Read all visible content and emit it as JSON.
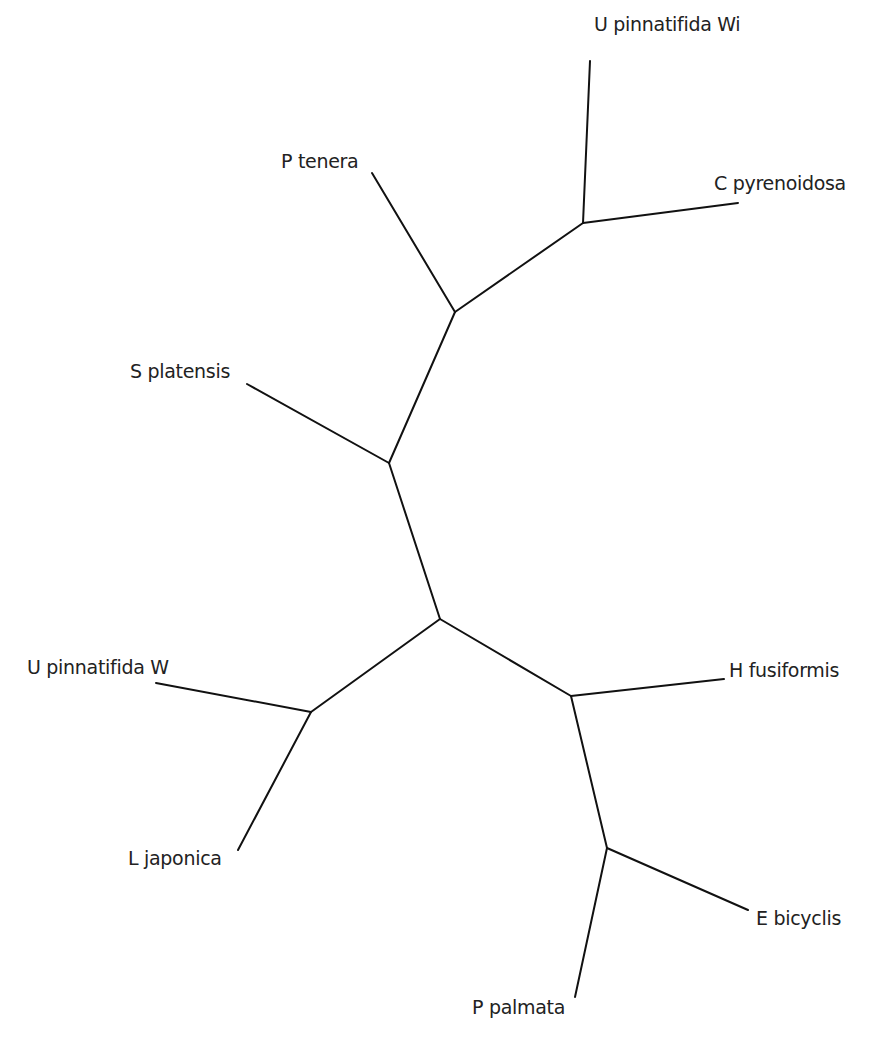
{
  "diagram": {
    "type": "unrooted-phylogenetic-tree",
    "line_color": "#111111",
    "text_color": "#222222",
    "nodes": {
      "n_center": {
        "x": 440,
        "y": 619
      },
      "n_upper": {
        "x": 389,
        "y": 463
      },
      "n_ptenera": {
        "x": 455,
        "y": 312
      },
      "n_chloro": {
        "x": 583,
        "y": 223
      },
      "n_left": {
        "x": 311,
        "y": 712
      },
      "n_right": {
        "x": 571,
        "y": 696
      },
      "n_bottom": {
        "x": 607,
        "y": 848
      }
    },
    "taxa": [
      {
        "label": "U pinnatifida Wi",
        "tip": {
          "x": 590,
          "y": 61
        },
        "parent": "n_chloro",
        "label_pos": {
          "x": 594,
          "y": 31
        }
      },
      {
        "label": "C pyrenoidosa",
        "tip": {
          "x": 738,
          "y": 203
        },
        "parent": "n_chloro",
        "label_pos": {
          "x": 714,
          "y": 190
        }
      },
      {
        "label": "P tenera",
        "tip": {
          "x": 372,
          "y": 173
        },
        "parent": "n_ptenera",
        "label_pos": {
          "x": 281,
          "y": 168
        }
      },
      {
        "label": "S platensis",
        "tip": {
          "x": 247,
          "y": 384
        },
        "parent": "n_upper",
        "label_pos": {
          "x": 130,
          "y": 378
        }
      },
      {
        "label": "U pinnatifida W",
        "tip": {
          "x": 156,
          "y": 683
        },
        "parent": "n_left",
        "label_pos": {
          "x": 27,
          "y": 674
        }
      },
      {
        "label": "L japonica",
        "tip": {
          "x": 238,
          "y": 850
        },
        "parent": "n_left",
        "label_pos": {
          "x": 128,
          "y": 865
        }
      },
      {
        "label": "H fusiformis",
        "tip": {
          "x": 724,
          "y": 679
        },
        "parent": "n_right",
        "label_pos": {
          "x": 729,
          "y": 677
        }
      },
      {
        "label": "E bicyclis",
        "tip": {
          "x": 748,
          "y": 910
        },
        "parent": "n_bottom",
        "label_pos": {
          "x": 756,
          "y": 925
        }
      },
      {
        "label": "P palmata",
        "tip": {
          "x": 575,
          "y": 997
        },
        "parent": "n_bottom",
        "label_pos": {
          "x": 472,
          "y": 1014
        }
      }
    ],
    "internal_edges": [
      {
        "from": "n_center",
        "to": "n_upper"
      },
      {
        "from": "n_upper",
        "to": "n_ptenera"
      },
      {
        "from": "n_ptenera",
        "to": "n_chloro"
      },
      {
        "from": "n_center",
        "to": "n_left"
      },
      {
        "from": "n_center",
        "to": "n_right"
      },
      {
        "from": "n_right",
        "to": "n_bottom"
      }
    ]
  }
}
